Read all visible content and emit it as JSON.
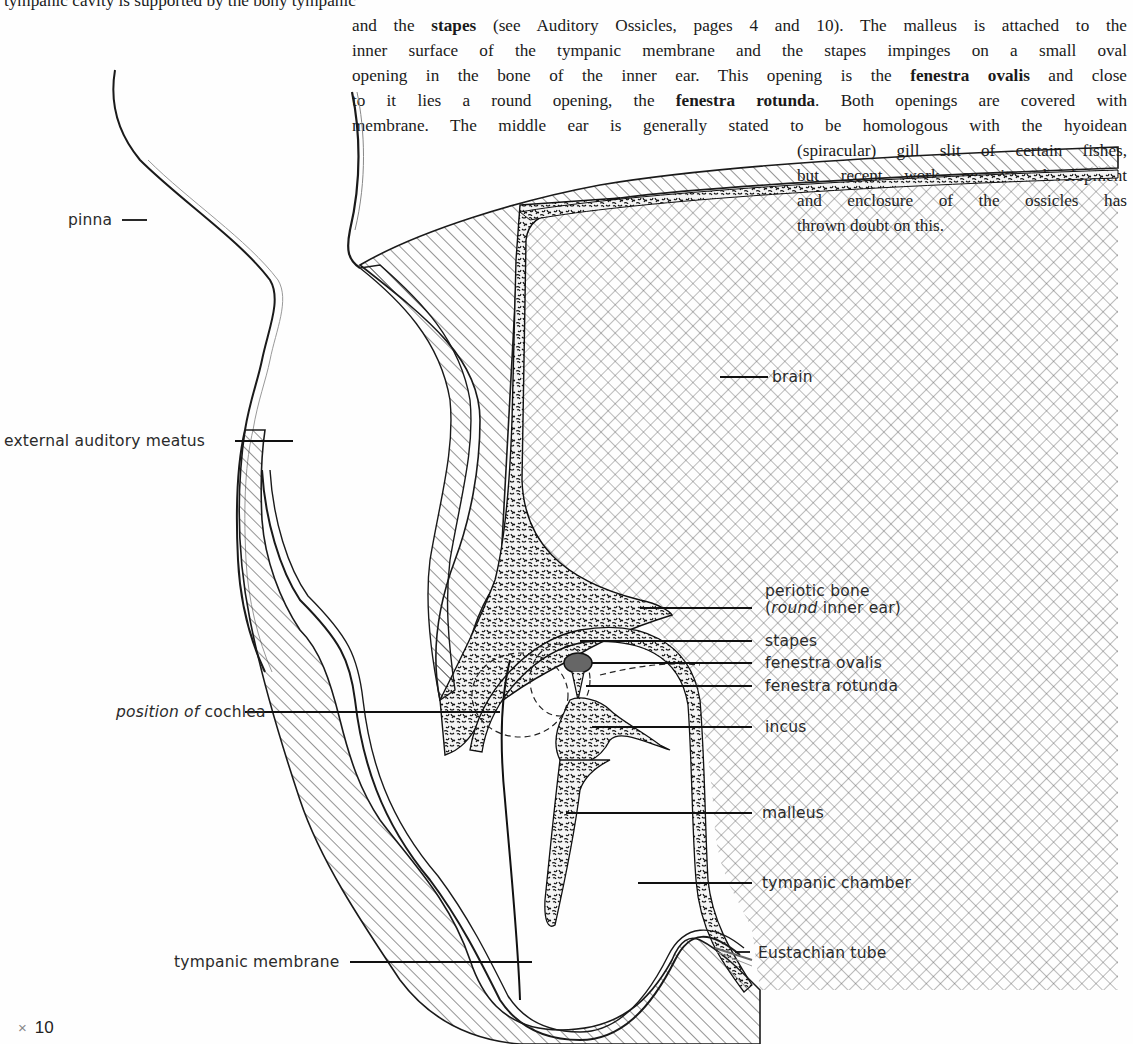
{
  "text": {
    "top_line_fragment": "tympanic cavity is supported by the bony tympanic",
    "col_lines": [
      {
        "parts": [
          {
            "t": "and the "
          },
          {
            "t": "stapes",
            "b": true
          },
          {
            "t": " (see Auditory Ossicles, pages 4 and 10).  The malleus is attached to the"
          }
        ]
      },
      {
        "parts": [
          {
            "t": "inner surface of the tympanic membrane and the stapes impinges on a small oval"
          }
        ]
      },
      {
        "parts": [
          {
            "t": "opening in the bone of the inner ear.  This opening is the "
          },
          {
            "t": "fenestra ovalis",
            "b": true
          },
          {
            "t": " and close"
          }
        ]
      },
      {
        "parts": [
          {
            "t": "to it lies a round opening, the "
          },
          {
            "t": "fenestra rotunda",
            "b": true
          },
          {
            "t": ".  Both openings are covered with"
          }
        ]
      },
      {
        "parts": [
          {
            "t": "membrane.  The middle ear is generally stated to be homologous with the hyoidean"
          }
        ]
      }
    ],
    "narrow_lines": [
      "(spiracular) gill slit of certain fishes,",
      "but recent work on its development",
      "and enclosure of the ossicles has",
      "thrown doubt on this."
    ]
  },
  "figure": {
    "labels": {
      "pinna": "pinna",
      "external_auditory_meatus": "external auditory meatus",
      "brain": "brain",
      "periotic_bone_line1": "periotic bone",
      "periotic_bone_line2_open": "(",
      "periotic_bone_line2_italic": "round",
      "periotic_bone_line2_rest": " inner ear)",
      "stapes": "stapes",
      "fenestra_ovalis": "fenestra ovalis",
      "fenestra_rotunda": "fenestra rotunda",
      "position_of_italic": "position of",
      "cochlea": " cochlea",
      "incus": "incus",
      "malleus": "malleus",
      "tympanic_chamber": "tympanic chamber",
      "tympanic_membrane": "tympanic membrane",
      "eustachian_tube": "Eustachian tube"
    },
    "magnification": {
      "symbol": "×",
      "value": "10"
    }
  }
}
